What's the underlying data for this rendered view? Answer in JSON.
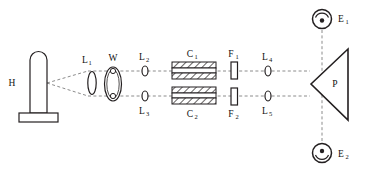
{
  "figure": {
    "type": "optical-bench-schematic",
    "background_color": "#ffffff",
    "line_color": "#231f20",
    "beam_color": "#8c8c8c",
    "width": 366,
    "height": 173
  },
  "components": {
    "source": {
      "label": "H",
      "label_sub": "",
      "name": "lamp-source",
      "description": "hydrogen discharge lamp with rounded top and rectangular base"
    },
    "lens1": {
      "label": "L",
      "label_sub": "1",
      "name": "lens-L1"
    },
    "chopper": {
      "label": "W",
      "label_sub": "",
      "name": "chopper-wheel-W"
    },
    "lens2": {
      "label": "L",
      "label_sub": "2",
      "name": "lens-L2"
    },
    "lens3": {
      "label": "L",
      "label_sub": "3",
      "name": "lens-L3"
    },
    "cell1": {
      "label": "C",
      "label_sub": "1",
      "name": "absorption-cell-C1"
    },
    "cell2": {
      "label": "C",
      "label_sub": "2",
      "name": "absorption-cell-C2"
    },
    "filter1": {
      "label": "F",
      "label_sub": "1",
      "name": "filter-F1"
    },
    "filter2": {
      "label": "F",
      "label_sub": "2",
      "name": "filter-F2"
    },
    "lens4": {
      "label": "L",
      "label_sub": "4",
      "name": "lens-L4"
    },
    "lens5": {
      "label": "L",
      "label_sub": "5",
      "name": "lens-L5"
    },
    "prism": {
      "label": "P",
      "label_sub": "",
      "name": "prism-P"
    },
    "detector1": {
      "label": "E",
      "label_sub": "1",
      "name": "detector-E1"
    },
    "detector2": {
      "label": "E",
      "label_sub": "2",
      "name": "detector-E2"
    }
  },
  "beams": {
    "upper_path": "H - L1 - W - L2 - C1 - F1 - L4 - P - E1",
    "lower_path": "H - L1 - W - L3 - C2 - F2 - L5 - P - E2"
  }
}
